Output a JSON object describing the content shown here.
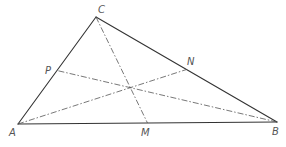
{
  "diagram": {
    "type": "triangle-medians",
    "vertices": {
      "A": {
        "label": "A",
        "x": 18,
        "y": 124
      },
      "B": {
        "label": "B",
        "x": 277,
        "y": 122
      },
      "C": {
        "label": "C",
        "x": 96,
        "y": 17
      }
    },
    "midpoints": {
      "M": {
        "label": "M",
        "x": 147.5,
        "y": 123,
        "on": "AB"
      },
      "N": {
        "label": "N",
        "x": 186.5,
        "y": 69.5,
        "on": "BC"
      },
      "P": {
        "label": "P",
        "x": 57,
        "y": 70.5,
        "on": "AC"
      }
    },
    "medians": [
      {
        "from": "C",
        "to": "M"
      },
      {
        "from": "A",
        "to": "N"
      },
      {
        "from": "B",
        "to": "P"
      }
    ],
    "centroid": {
      "x": 130.3,
      "y": 87.7
    },
    "colors": {
      "line": "#333333",
      "dashed": "#555555",
      "label": "#555555",
      "background": "#ffffff"
    }
  }
}
